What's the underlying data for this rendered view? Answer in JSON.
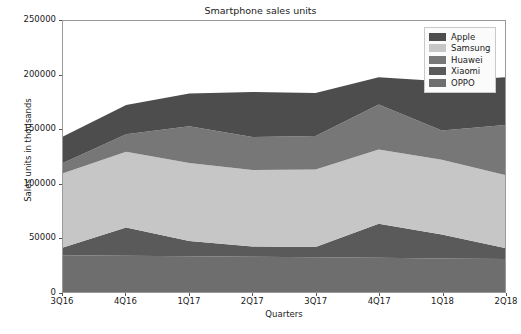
{
  "chart_data": {
    "type": "area",
    "stacked": true,
    "title": "Smartphone sales units",
    "xlabel": "Quarters",
    "ylabel": "Sales units in thousands",
    "categories": [
      "3Q16",
      "4Q16",
      "1Q17",
      "2Q17",
      "3Q17",
      "4Q17",
      "1Q18",
      "2Q18"
    ],
    "ylim": [
      0,
      250000
    ],
    "yticks": [
      0,
      50000,
      100000,
      150000,
      200000,
      250000
    ],
    "ytick_labels": [
      "0",
      "50000",
      "100000",
      "150000",
      "200000",
      "250000"
    ],
    "grid": false,
    "legend_position": "upper right",
    "stack_order_bottom_to_top": [
      "OPPO",
      "Xiaomi",
      "Samsung",
      "Huawei",
      "Apple"
    ],
    "series": [
      {
        "name": "Apple",
        "color": "#4d4d4d",
        "values": [
          24500,
          27000,
          30000,
          41500,
          39500,
          25000,
          45500,
          44000
        ]
      },
      {
        "name": "Samsung",
        "color": "#c6c6c6",
        "values": [
          68500,
          70000,
          72000,
          70500,
          71500,
          68500,
          69000,
          67500
        ]
      },
      {
        "name": "Huawei",
        "color": "#777777",
        "values": [
          9500,
          16000,
          34000,
          30500,
          31000,
          41500,
          27000,
          46000
        ]
      },
      {
        "name": "Xiaomi",
        "color": "#5a5a5a",
        "values": [
          7000,
          26000,
          14000,
          9500,
          9500,
          31500,
          22000,
          10000
        ]
      },
      {
        "name": "OPPO",
        "color": "#6e6e6e",
        "values": [
          34000,
          33500,
          33000,
          32500,
          32000,
          31500,
          31000,
          30500
        ]
      }
    ],
    "cumulative_totals": [
      143500,
      172500,
      183000,
      184500,
      183500,
      198000,
      194500,
      198000
    ]
  },
  "legend": {
    "items": [
      {
        "label": "Apple",
        "color": "#4d4d4d"
      },
      {
        "label": "Samsung",
        "color": "#c6c6c6"
      },
      {
        "label": "Huawei",
        "color": "#777777"
      },
      {
        "label": "Xiaomi",
        "color": "#5a5a5a"
      },
      {
        "label": "OPPO",
        "color": "#6e6e6e"
      }
    ]
  },
  "caption": {
    "text": ""
  }
}
